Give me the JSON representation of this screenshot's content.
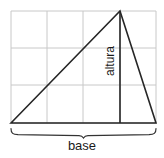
{
  "figure": {
    "labels": {
      "base": "base",
      "altura": "altura"
    },
    "colors": {
      "background": "#ffffff",
      "grid": "#c8c8c8",
      "stroke": "#262626",
      "text": "#1a1a1a",
      "brace": "#333333"
    },
    "grid": {
      "columns": 4,
      "rows": 3,
      "x_lines": [
        11,
        47,
        83,
        120,
        156
      ],
      "y_lines": [
        11,
        48,
        85,
        123
      ]
    },
    "triangle": {
      "vertices": [
        {
          "x": 11,
          "y": 123
        },
        {
          "x": 120,
          "y": 11
        },
        {
          "x": 156,
          "y": 123
        }
      ],
      "altitude": {
        "x": 120,
        "y_top": 11,
        "y_bottom": 123
      }
    },
    "brace": {
      "x_start": 11,
      "x_end": 156,
      "y": 129
    }
  }
}
